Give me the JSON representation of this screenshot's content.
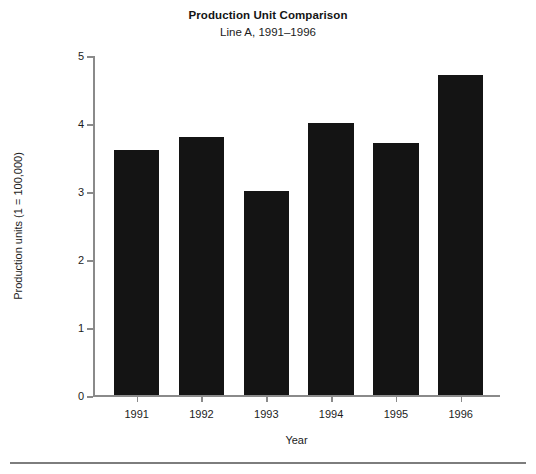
{
  "chart_data": {
    "type": "bar",
    "title": "Production Unit Comparison",
    "subtitle": "Line A, 1991–1996",
    "xlabel": "Year",
    "ylabel": "Production units (1 = 100,000)",
    "categories": [
      "1991",
      "1992",
      "1993",
      "1994",
      "1995",
      "1996"
    ],
    "values": [
      3.6,
      3.8,
      3.0,
      4.0,
      3.7,
      4.7
    ],
    "ylim": [
      0,
      5
    ],
    "yticks": [
      "0",
      "1",
      "2",
      "3",
      "4",
      "5"
    ],
    "ytick_values": [
      0,
      1,
      2,
      3,
      4,
      5
    ],
    "grid": false,
    "legend": null,
    "bar_color": "#141414",
    "axis_color": "#8a8a8a",
    "background_color": "#ffffff"
  }
}
